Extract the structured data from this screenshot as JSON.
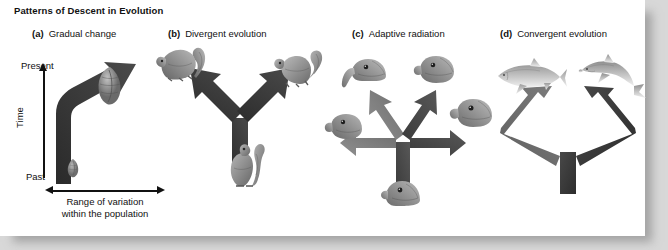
{
  "figure": {
    "title": "Patterns of Descent in Evolution",
    "background_color": "#d8d8d8",
    "page_color": "#ffffff"
  },
  "axes": {
    "y_top_label": "Present",
    "y_bottom_label": "Past",
    "y_axis_label": "Time",
    "x_axis_label_line1": "Range of variation",
    "x_axis_label_line2": "within the population"
  },
  "panels": [
    {
      "key": "a",
      "letter": "(a)",
      "label": "Gradual change",
      "arrow_color": "#2f2f2f",
      "organisms": [
        "small-ancestral-organism",
        "large-descendant-organism"
      ]
    },
    {
      "key": "b",
      "letter": "(b)",
      "label": "Divergent evolution",
      "arrow_color": "#3a3a3a",
      "organisms": [
        "ancestral-squirrel",
        "descendant-squirrel-left",
        "descendant-squirrel-right"
      ]
    },
    {
      "key": "c",
      "letter": "(c)",
      "label": "Adaptive radiation",
      "arrow_color": "#5a5a5a",
      "organisms": [
        "ancestral-finch-head",
        "finch-head-upper-left",
        "finch-head-upper-right",
        "finch-head-left",
        "finch-head-right"
      ]
    },
    {
      "key": "d",
      "letter": "(d)",
      "label": "Convergent evolution",
      "arrow_color": "#4a4a4a",
      "organisms": [
        "shark",
        "dolphin"
      ]
    }
  ]
}
